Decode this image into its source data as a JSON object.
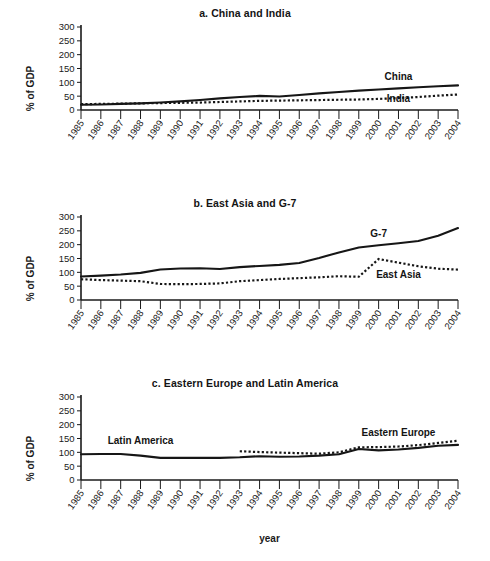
{
  "figure": {
    "xlabel": "year",
    "ylabel": "% of GDP"
  },
  "chart_data": [
    {
      "type": "line",
      "panel": "a",
      "title": "a. China and India",
      "xlabel": "",
      "ylabel": "% of GDP",
      "ylim": [
        0,
        300
      ],
      "yticks": [
        0,
        50,
        100,
        150,
        200,
        250,
        300
      ],
      "grid": false,
      "legend_position": "inline-right",
      "x": [
        1985,
        1986,
        1987,
        1988,
        1989,
        1990,
        1991,
        1992,
        1993,
        1994,
        1995,
        1996,
        1997,
        1998,
        1999,
        2000,
        2001,
        2002,
        2003,
        2004
      ],
      "categories": [
        "1985",
        "1986",
        "1987",
        "1988",
        "1989",
        "1990",
        "1991",
        "1992",
        "1993",
        "1994",
        "1995",
        "1996",
        "1997",
        "1998",
        "1999",
        "2000",
        "2001",
        "2002",
        "2003",
        "2004"
      ],
      "series": [
        {
          "name": "China",
          "style": "solid",
          "label_x": 2001,
          "label_y": 108,
          "values": [
            19,
            20,
            22,
            24,
            27,
            31,
            36,
            42,
            47,
            51,
            49,
            54,
            60,
            65,
            70,
            74,
            78,
            82,
            86,
            89
          ]
        },
        {
          "name": "India",
          "style": "dotted",
          "label_x": 2001,
          "label_y": 28,
          "values": [
            21,
            22,
            23,
            24,
            25,
            26,
            27,
            29,
            31,
            33,
            34,
            35,
            36,
            37,
            38,
            40,
            43,
            47,
            52,
            56
          ]
        }
      ]
    },
    {
      "type": "line",
      "panel": "b",
      "title": "b. East Asia and G-7",
      "xlabel": "",
      "ylabel": "% of GDP",
      "ylim": [
        0,
        300
      ],
      "yticks": [
        0,
        50,
        100,
        150,
        200,
        250,
        300
      ],
      "grid": false,
      "legend_position": "inline-right",
      "x": [
        1985,
        1986,
        1987,
        1988,
        1989,
        1990,
        1991,
        1992,
        1993,
        1994,
        1995,
        1996,
        1997,
        1998,
        1999,
        2000,
        2001,
        2002,
        2003,
        2004
      ],
      "categories": [
        "1985",
        "1986",
        "1987",
        "1988",
        "1989",
        "1990",
        "1991",
        "1992",
        "1993",
        "1994",
        "1995",
        "1996",
        "1997",
        "1998",
        "1999",
        "2000",
        "2001",
        "2002",
        "2003",
        "2004"
      ],
      "series": [
        {
          "name": "G-7",
          "style": "solid",
          "label_x": 2000,
          "label_y": 228,
          "values": [
            85,
            88,
            92,
            98,
            110,
            114,
            115,
            112,
            119,
            123,
            127,
            134,
            152,
            172,
            190,
            198,
            205,
            213,
            232,
            260
          ]
        },
        {
          "name": "East Asia",
          "style": "dotted",
          "label_x": 2001,
          "label_y": 78,
          "values": [
            75,
            72,
            70,
            68,
            58,
            57,
            58,
            60,
            68,
            72,
            76,
            79,
            82,
            86,
            84,
            148,
            135,
            122,
            113,
            110
          ]
        }
      ]
    },
    {
      "type": "line",
      "panel": "c",
      "title": "c. Eastern Europe and Latin America",
      "xlabel": "year",
      "ylabel": "% of GDP",
      "ylim": [
        0,
        300
      ],
      "yticks": [
        0,
        50,
        100,
        150,
        200,
        250,
        300
      ],
      "grid": false,
      "legend_position": "inline",
      "x": [
        1985,
        1986,
        1987,
        1988,
        1989,
        1990,
        1991,
        1992,
        1993,
        1994,
        1995,
        1996,
        1997,
        1998,
        1999,
        2000,
        2001,
        2002,
        2003,
        2004
      ],
      "categories": [
        "1985",
        "1986",
        "1987",
        "1988",
        "1989",
        "1990",
        "1991",
        "1992",
        "1993",
        "1994",
        "1995",
        "1996",
        "1997",
        "1998",
        "1999",
        "2000",
        "2001",
        "2002",
        "2003",
        "2004"
      ],
      "series": [
        {
          "name": "Latin America",
          "style": "solid",
          "label_x": 1988,
          "label_y": 130,
          "values": [
            93,
            94,
            94,
            88,
            80,
            80,
            80,
            80,
            82,
            86,
            84,
            85,
            88,
            93,
            112,
            107,
            110,
            116,
            124,
            127
          ]
        },
        {
          "name": "Eastern Europe",
          "style": "dotted",
          "label_x": 2001,
          "label_y": 160,
          "values": [
            null,
            null,
            null,
            null,
            null,
            null,
            null,
            null,
            104,
            101,
            99,
            97,
            95,
            100,
            118,
            119,
            121,
            126,
            134,
            142
          ]
        }
      ]
    }
  ]
}
